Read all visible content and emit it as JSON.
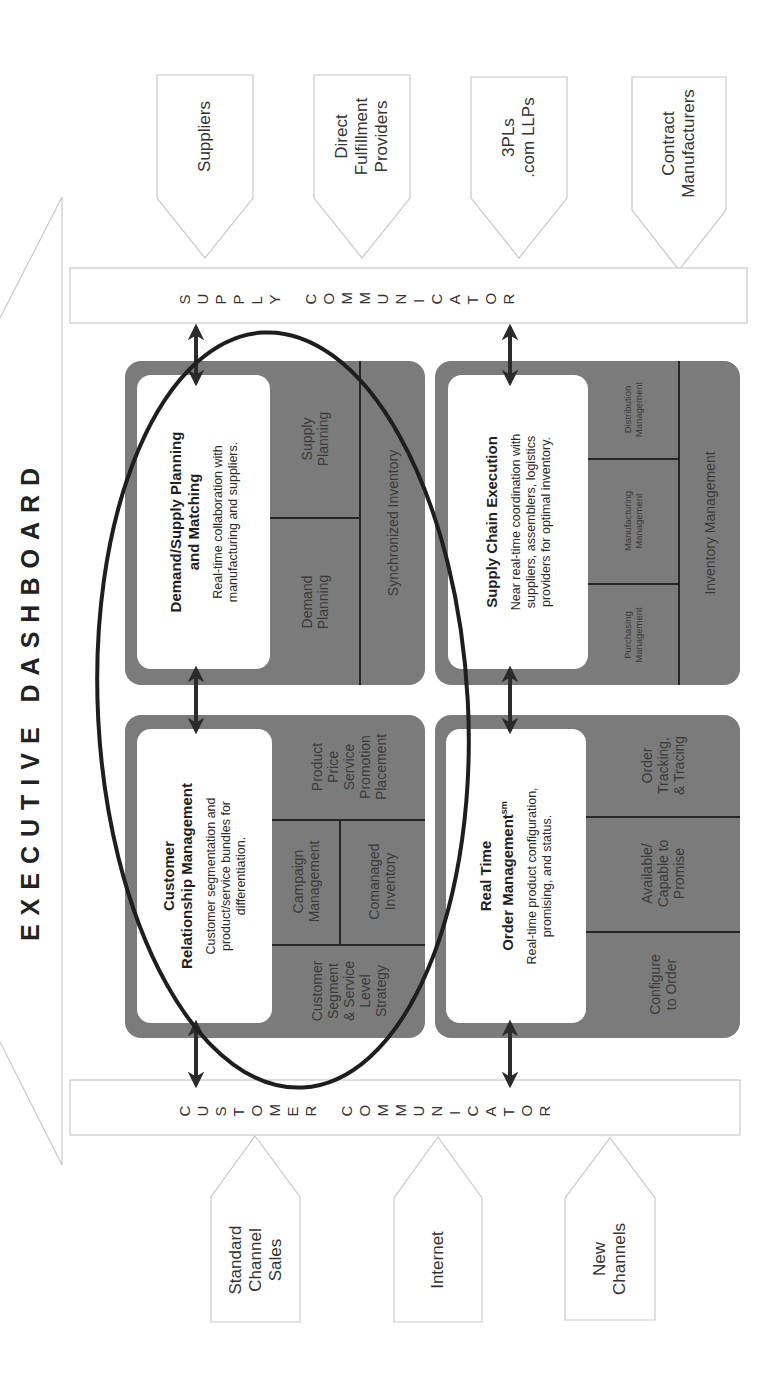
{
  "title": "EXECUTIVE DASHBOARD",
  "supply_partners": [
    {
      "label": "Suppliers"
    },
    {
      "label": "Direct\nFulfillment\nProviders"
    },
    {
      "label": "3PLs\n.com LLPs"
    },
    {
      "label": "Contract\nManufacturers"
    }
  ],
  "supply_communicator": {
    "label": "SUPPLY COMMUNICATOR"
  },
  "customer_communicator": {
    "label": "CUSTOMER COMMUNICATOR"
  },
  "customer_channels": [
    {
      "label": "Standard\nChannel\nSales"
    },
    {
      "label": "Internet"
    },
    {
      "label": "New\nChannels"
    }
  ],
  "blocks": {
    "demand_supply": {
      "title": "Demand/Supply Planning\nand Matching",
      "description": "Real-time collaboration with\nmanufacturing and suppliers.",
      "cells": {
        "demand_planning": "Demand\nPlanning",
        "supply_planning": "Supply\nPlanning",
        "synchronized_inventory": "Synchronized Inventory"
      }
    },
    "supply_chain_execution": {
      "title": "Supply Chain Execution",
      "description": "Near real-time coordination with\nsuppliers, assemblers, logistics\nproviders for optimal inventory.",
      "cells": {
        "purchasing": "Purchasing\nManagement",
        "manufacturing": "Manufacturing\nManagement",
        "distribution": "Distribution\nManagement",
        "inventory": "Inventory Management"
      }
    },
    "crm": {
      "title": "Customer\nRelationship Management",
      "description": "Customer segmentation and\nproduct/service bundles for\ndifferentiation.",
      "cells": {
        "segment_strategy": "Customer\nSegment\n& Service\nLevel\nStrategy",
        "campaign": "Campaign\nManagement",
        "comanaged": "Comanaged\nInventory",
        "four_p": "Product\nPrice\nService\nPromotion\nPlacement"
      }
    },
    "order_management": {
      "title_line1": "Real Time",
      "title_line2": "Order Management",
      "title_sup": "sm",
      "description": "Real-time product configuration,\npromising, and status.",
      "cells": {
        "configure": "Configure\nto Order",
        "atp_ctp": "Available/\nCapable to\nPromise",
        "tracking": "Order\nTracking,\n& Tracing"
      }
    }
  },
  "colors": {
    "block_gray": "#7b7b7b",
    "arrow": "#2b2b2b",
    "outline": "#c8c8c8",
    "ellipse": "#1e1e1e"
  }
}
